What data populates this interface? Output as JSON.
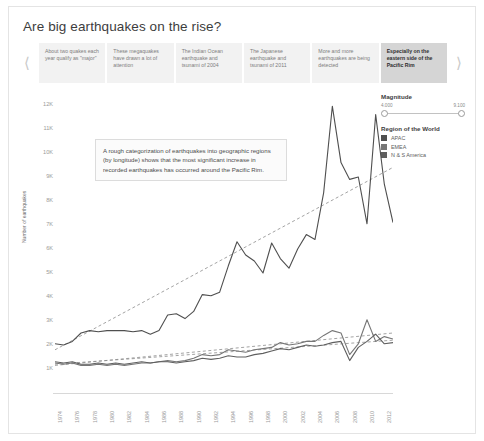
{
  "header": {
    "title": "Are big earthquakes on the rise?"
  },
  "carousel": {
    "prev_icon": "chevron-left-icon",
    "next_icon": "chevron-right-icon",
    "tabs": [
      {
        "label": "About two quakes each year qualify as \"major\"",
        "active": false
      },
      {
        "label": "These megaquakes have drawn a lot of attention",
        "active": false
      },
      {
        "label": "The Indian Ocean earthquake and tsunami of 2004",
        "active": false
      },
      {
        "label": "The Japanese earthquake and tsunami of 2011",
        "active": false
      },
      {
        "label": "More and more earthquakes are being detected",
        "active": false
      },
      {
        "label": "Especially on the eastern side of the Pacific Rim",
        "active": true
      }
    ]
  },
  "legend": {
    "magnitude": {
      "title": "Magnitude",
      "min_label": "4.000",
      "max_label": "9.100"
    },
    "region": {
      "title": "Region of the World",
      "items": [
        {
          "label": "APAC",
          "color": "#4f4f4f"
        },
        {
          "label": "EMEA",
          "color": "#767676"
        },
        {
          "label": "N & S America",
          "color": "#5f5f5f"
        }
      ]
    }
  },
  "annotation": {
    "text": "A rough categorization of earthquakes into geographic regions (by longitude) shows that the most significant increase in recorded earthquakes has occurred around the Pacific Rim."
  },
  "chart_data": {
    "type": "line",
    "title": "Are big earthquakes on the rise?",
    "xlabel": "",
    "ylabel": "Number of earthquakes",
    "ylim": [
      0,
      12500
    ],
    "yticks": [
      1000,
      2000,
      3000,
      4000,
      5000,
      6000,
      7000,
      8000,
      9000,
      10000,
      11000,
      12000
    ],
    "ytick_labels": [
      "1K",
      "2K",
      "3K",
      "4K",
      "5K",
      "6K",
      "7K",
      "8K",
      "9K",
      "10K",
      "11K",
      "12K"
    ],
    "grid": false,
    "legend_position": "right",
    "x": [
      1974,
      1975,
      1976,
      1977,
      1978,
      1979,
      1980,
      1981,
      1982,
      1983,
      1984,
      1985,
      1986,
      1987,
      1988,
      1989,
      1990,
      1991,
      1992,
      1993,
      1994,
      1995,
      1996,
      1997,
      1998,
      1999,
      2000,
      2001,
      2002,
      2003,
      2004,
      2005,
      2006,
      2007,
      2008,
      2009,
      2010,
      2011,
      2012,
      2013
    ],
    "xtick_labels": [
      "1974",
      "1976",
      "1978",
      "1980",
      "1982",
      "1984",
      "1986",
      "1988",
      "1990",
      "1992",
      "1994",
      "1996",
      "1998",
      "2000",
      "2002",
      "2004",
      "2006",
      "2008",
      "2010",
      "2012"
    ],
    "series": [
      {
        "name": "APAC",
        "color": "#4f4f4f",
        "values": [
          2050,
          2000,
          2150,
          2500,
          2600,
          2550,
          2600,
          2600,
          2600,
          2550,
          2600,
          2450,
          2600,
          3250,
          3300,
          3100,
          3400,
          4100,
          4050,
          4200,
          5300,
          6300,
          5750,
          5500,
          5000,
          6250,
          5600,
          5200,
          6000,
          6600,
          6400,
          8350,
          11950,
          9600,
          8900,
          9000,
          7050,
          11600,
          8700,
          7100
        ]
      },
      {
        "name": "EMEA",
        "color": "#767676",
        "values": [
          1250,
          1200,
          1250,
          1150,
          1150,
          1200,
          1150,
          1200,
          1150,
          1200,
          1250,
          1250,
          1300,
          1350,
          1300,
          1350,
          1450,
          1600,
          1550,
          1600,
          1800,
          1750,
          1700,
          1800,
          1850,
          1900,
          2100,
          2000,
          2050,
          2150,
          2150,
          2400,
          2600,
          2500,
          1600,
          2050,
          3050,
          2150,
          2350,
          2250
        ]
      },
      {
        "name": "N & S America",
        "color": "#5f5f5f",
        "values": [
          1300,
          1250,
          1300,
          1200,
          1200,
          1250,
          1200,
          1250,
          1200,
          1250,
          1300,
          1250,
          1300,
          1300,
          1250,
          1300,
          1350,
          1450,
          1400,
          1450,
          1550,
          1500,
          1500,
          1600,
          1650,
          1750,
          1850,
          1800,
          1900,
          2000,
          1950,
          2000,
          2100,
          2150,
          1350,
          1900,
          2150,
          2450,
          2050,
          2100
        ]
      }
    ],
    "trendlines": [
      {
        "name": "APAC trend",
        "from": [
          1974,
          1800
        ],
        "to": [
          2013,
          9400
        ],
        "style": "dashed"
      },
      {
        "name": "EMEA trend",
        "from": [
          1974,
          1150
        ],
        "to": [
          2013,
          2500
        ],
        "style": "dashed"
      },
      {
        "name": "N & S America trend",
        "from": [
          1974,
          1200
        ],
        "to": [
          2013,
          2200
        ],
        "style": "dashed"
      }
    ]
  }
}
